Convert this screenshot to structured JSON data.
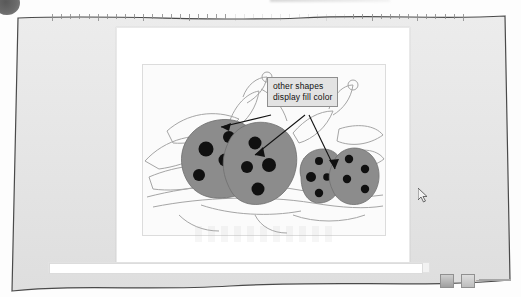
{
  "window": {
    "app_kind": "presentation-slide-editor",
    "frame_color": "#e6e6e6",
    "page_color": "#ffffff"
  },
  "corner": {
    "bullet_icon": "dark-circle-bullet"
  },
  "ruler": {
    "name": "horizontal-ruler",
    "tick_count": 46
  },
  "slide": {
    "picture": {
      "name": "ladybug-clipart",
      "fill_color": "#8c8c8c",
      "dot_color": "#101010",
      "outline_color": "#9a9a9a",
      "background_color": "#fbfbfb"
    },
    "callout": {
      "line1": "other shapes",
      "line2": "display fill color",
      "bg_color": "#e3e3e3",
      "border_color": "#8f8f8f",
      "arrow_count": 3
    }
  },
  "statusbar": {
    "view_buttons": [
      {
        "label": "",
        "icon": "normal-view-icon"
      },
      {
        "label": "",
        "icon": "slide-sorter-view-icon"
      }
    ],
    "zoom": {
      "minus_label": "–",
      "handle_name": "zoom-slider-handle"
    },
    "hscrollbar_name": "horizontal-scrollbar"
  },
  "pointer": {
    "icon": "mouse-arrow-cursor",
    "x": 418,
    "y": 188
  }
}
